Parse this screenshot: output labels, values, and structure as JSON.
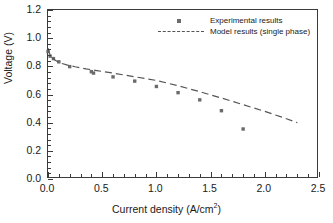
{
  "chart_data": {
    "type": "scatter",
    "title": "",
    "xlabel_text": "Current density (A/cm",
    "xlabel_sup": "2",
    "xlabel_tail": ")",
    "xlabel": "Current density (A/cm2)",
    "ylabel": "Voltage (V)",
    "xlim": [
      0.0,
      2.5
    ],
    "ylim": [
      0.0,
      1.2
    ],
    "grid": false,
    "xticks": [
      "0.0",
      "0.5",
      "1.0",
      "1.5",
      "2.0",
      "2.5"
    ],
    "xtick_values": [
      0.0,
      0.5,
      1.0,
      1.5,
      2.0,
      2.5
    ],
    "yticks": [
      "0.0",
      "0.2",
      "0.4",
      "0.6",
      "0.8",
      "1.0",
      "1.2"
    ],
    "ytick_values": [
      0.0,
      0.2,
      0.4,
      0.6,
      0.8,
      1.0,
      1.2
    ],
    "minor_ticks_per_interval": 5,
    "legend_position": "top-center",
    "series": [
      {
        "name": "Experimental results",
        "type": "scatter",
        "marker": "square",
        "color": "#6b6b6b",
        "x": [
          0.0,
          0.02,
          0.05,
          0.1,
          0.2,
          0.4,
          0.42,
          0.6,
          0.8,
          1.0,
          1.2,
          1.4,
          1.6,
          1.8
        ],
        "y": [
          0.905,
          0.872,
          0.855,
          0.832,
          0.798,
          0.762,
          0.752,
          0.725,
          0.695,
          0.657,
          0.613,
          0.562,
          0.485,
          0.355
        ]
      },
      {
        "name": "Model results (single phase)",
        "type": "line",
        "style": "dashed",
        "color": "#555555",
        "x": [
          0.0,
          0.01,
          0.02,
          0.04,
          0.06,
          0.09,
          0.13,
          0.18,
          0.25,
          0.35,
          0.45,
          0.6,
          0.8,
          1.0,
          1.2,
          1.4,
          1.6,
          1.8,
          2.0,
          2.2,
          2.3
        ],
        "y": [
          0.93,
          0.9,
          0.882,
          0.86,
          0.846,
          0.832,
          0.82,
          0.809,
          0.797,
          0.782,
          0.77,
          0.752,
          0.726,
          0.7,
          0.662,
          0.62,
          0.575,
          0.528,
          0.48,
          0.428,
          0.4
        ]
      }
    ]
  },
  "legend": {
    "items": [
      {
        "label": "Experimental results"
      },
      {
        "label": "Model results (single phase)"
      }
    ]
  }
}
